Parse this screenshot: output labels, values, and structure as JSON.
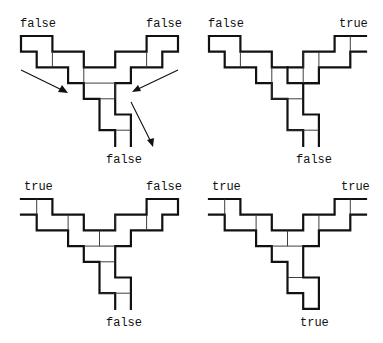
{
  "grid_unit": 15.7,
  "colors": {
    "line": "#111111",
    "background": "#ffffff"
  },
  "panels": [
    {
      "id": "p1",
      "origin": [
        21,
        36
      ],
      "labels": {
        "top_left": "false",
        "top_right": "false",
        "bottom": "false"
      },
      "has_arrows": true
    },
    {
      "id": "p2",
      "origin": [
        209,
        36
      ],
      "labels": {
        "top_left": "false",
        "top_right": "true",
        "bottom": "false"
      },
      "has_arrows": false
    },
    {
      "id": "p3",
      "origin": [
        21,
        199
      ],
      "labels": {
        "top_left": "true",
        "top_right": "false",
        "bottom": "false"
      },
      "has_arrows": false
    },
    {
      "id": "p4",
      "origin": [
        209,
        199
      ],
      "labels": {
        "top_left": "true",
        "top_right": "true",
        "bottom": "true"
      },
      "has_arrows": false
    }
  ]
}
